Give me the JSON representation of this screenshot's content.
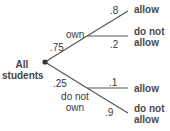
{
  "diagram": {
    "type": "probability-tree",
    "root": {
      "label_line1": "All",
      "label_line2": "students"
    },
    "level1": [
      {
        "label": "own",
        "prob": ".75"
      },
      {
        "label_line1": "do not",
        "label_line2": "own",
        "prob": ".25"
      }
    ],
    "level2": {
      "own": [
        {
          "label": "allow",
          "prob": ".8"
        },
        {
          "label_line1": "do not",
          "label_line2": "allow",
          "prob": ".2"
        }
      ],
      "do_not_own": [
        {
          "label": "allow",
          "prob": ".1"
        },
        {
          "label_line1": "do not",
          "label_line2": "allow",
          "prob": ".9"
        }
      ]
    },
    "colors": {
      "line": "#555555",
      "text": "#3a3a3a",
      "node": "#333333"
    }
  }
}
